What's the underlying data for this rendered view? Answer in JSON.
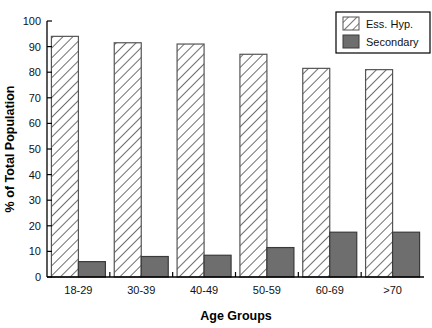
{
  "chart_data": {
    "type": "bar",
    "title": "",
    "xlabel": "Age Groups",
    "ylabel": "% of Total Population",
    "categories": [
      "18-29",
      "30-39",
      "40-49",
      "50-59",
      "60-69",
      ">70"
    ],
    "series": [
      {
        "name": "Ess. Hyp.",
        "values": [
          94,
          91.5,
          91,
          87,
          81.5,
          81
        ],
        "fill": "hatch-diagonal",
        "color": "#ffffff",
        "edge": "#555555"
      },
      {
        "name": "Secondary",
        "values": [
          6,
          8,
          8.5,
          11.5,
          17.5,
          17.5
        ],
        "fill": "solid",
        "color": "#6e6e6e",
        "edge": "#3a3a3a"
      }
    ],
    "ylim": [
      0,
      100
    ],
    "yticks": [
      0,
      10,
      20,
      30,
      40,
      50,
      60,
      70,
      80,
      90,
      100
    ],
    "ytick_labels": [
      "0",
      "10",
      "20",
      "30",
      "40",
      "50",
      "60",
      "70",
      "80",
      "90",
      "100"
    ],
    "grid": false,
    "legend_position": "top-right",
    "legend_entries": [
      "Ess. Hyp.",
      "Secondary"
    ],
    "axis_color": "#000000"
  }
}
